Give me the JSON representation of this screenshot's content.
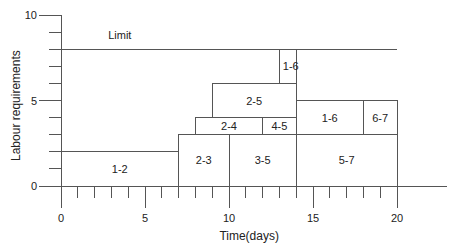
{
  "chart_data": {
    "type": "resource-histogram",
    "title": "",
    "xlabel": "Time(days)",
    "ylabel": "Labour requirements",
    "xlim": [
      0,
      23
    ],
    "ylim": [
      0,
      10
    ],
    "x_ticks": [
      0,
      5,
      10,
      15,
      20
    ],
    "y_ticks": [
      0,
      5,
      10
    ],
    "x_minor_step": 1,
    "y_minor_step": 1,
    "grid": false,
    "limit": {
      "label": "Limit",
      "value": 8,
      "x_range": [
        0,
        20
      ]
    },
    "blocks": [
      {
        "label": "1-2",
        "start": 0,
        "end": 7,
        "bottom": 0,
        "top": 2
      },
      {
        "label": "2-3",
        "start": 7,
        "end": 10,
        "bottom": 0,
        "top": 3
      },
      {
        "label": "3-5",
        "start": 10,
        "end": 14,
        "bottom": 0,
        "top": 3
      },
      {
        "label": "2-4",
        "start": 8,
        "end": 12,
        "bottom": 3,
        "top": 4
      },
      {
        "label": "4-5",
        "start": 12,
        "end": 14,
        "bottom": 3,
        "top": 4
      },
      {
        "label": "2-5",
        "start": 9,
        "end": 14,
        "bottom": 4,
        "top": 6
      },
      {
        "label": "1-6",
        "start": 13,
        "end": 14,
        "bottom": 6,
        "top": 8
      },
      {
        "label": "5-7",
        "start": 14,
        "end": 20,
        "bottom": 0,
        "top": 3
      },
      {
        "label": "1-6",
        "start": 14,
        "end": 18,
        "bottom": 3,
        "top": 5
      },
      {
        "label": "6-7",
        "start": 18,
        "end": 20,
        "bottom": 3,
        "top": 5
      }
    ]
  },
  "colors": {
    "line": "#555555",
    "text": "#222222"
  }
}
